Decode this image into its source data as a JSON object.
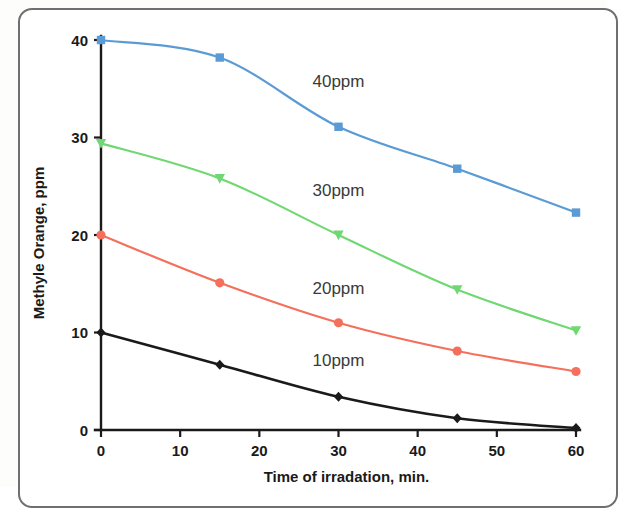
{
  "chart_data": {
    "type": "line",
    "title": "",
    "subtitle": "",
    "xlabel": "Time of irradation, min.",
    "ylabel": "Methyle Orange, ppm",
    "x": [
      0,
      15,
      30,
      45,
      60
    ],
    "xlim": [
      0,
      60
    ],
    "ylim": [
      0,
      40
    ],
    "xticks": [
      0,
      10,
      20,
      30,
      40,
      50,
      60
    ],
    "yticks": [
      0,
      10,
      20,
      30,
      40
    ],
    "xtick_labels": [
      "0",
      "10",
      "20",
      "30",
      "40",
      "50",
      "60"
    ],
    "ytick_labels": [
      "0",
      "10",
      "20",
      "30",
      "40"
    ],
    "grid": false,
    "legend_position": "inline-annotations",
    "series": [
      {
        "name": "40ppm",
        "label": "40ppm",
        "color": "#5b9bd5",
        "marker": "square",
        "values": [
          40.0,
          38.2,
          31.1,
          26.8,
          22.3
        ],
        "label_x": 30,
        "label_y": 35.2
      },
      {
        "name": "30ppm",
        "label": "30ppm",
        "color": "#70d873",
        "marker": "triangle",
        "values": [
          29.4,
          25.8,
          20.0,
          14.4,
          10.2
        ],
        "label_x": 30,
        "label_y": 24.0
      },
      {
        "name": "20ppm",
        "label": "20ppm",
        "color": "#f4705c",
        "marker": "circle",
        "values": [
          20.0,
          15.1,
          11.0,
          8.1,
          6.0
        ],
        "label_x": 30,
        "label_y": 14.0
      },
      {
        "name": "10ppm",
        "label": "10ppm",
        "color": "#1a1a1a",
        "marker": "diamond",
        "values": [
          10.0,
          6.7,
          3.4,
          1.2,
          0.2
        ],
        "label_x": 30,
        "label_y": 6.6
      }
    ]
  },
  "colors": {
    "background": "#ffffff",
    "axis": "#1a1a1a",
    "frame": "#6f6f6f",
    "series_40ppm": "#5b9bd5",
    "series_30ppm": "#70d873",
    "series_20ppm": "#f4705c",
    "series_10ppm": "#1a1a1a"
  }
}
